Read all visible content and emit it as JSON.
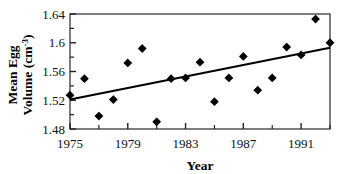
{
  "chart_data": {
    "type": "scatter",
    "title": "",
    "xlabel": "Year",
    "ylabel": "Mean Egg Volume (cm3)",
    "ylabel_line1": "Mean Egg",
    "ylabel_line2_prefix": "Volume (cm",
    "ylabel_line2_superscript": "-3",
    "ylabel_line2_suffix": ")",
    "xlim": [
      1975,
      1993
    ],
    "ylim": [
      1.48,
      1.64
    ],
    "grid": false,
    "legend": null,
    "x_tick_labels": [
      "1975",
      "1979",
      "1983",
      "1987",
      "1991"
    ],
    "x_tick_values": [
      1975,
      1979,
      1983,
      1987,
      1991
    ],
    "x_minor_tick_values": [
      1977,
      1981,
      1985,
      1989,
      1993
    ],
    "y_tick_labels": [
      "1.48",
      "1.52",
      "1.56",
      "1.6",
      "1.64"
    ],
    "y_tick_values": [
      1.48,
      1.52,
      1.56,
      1.6,
      1.64
    ],
    "y_minor_tick_values": [
      1.5,
      1.54,
      1.58,
      1.62
    ],
    "x": [
      1975,
      1976,
      1977,
      1978,
      1979,
      1980,
      1981,
      1982,
      1983,
      1984,
      1985,
      1986,
      1987,
      1988,
      1989,
      1990,
      1991,
      1992,
      1993
    ],
    "values": [
      1.527,
      1.55,
      1.498,
      1.521,
      1.572,
      1.592,
      1.49,
      1.55,
      1.551,
      1.573,
      1.518,
      1.551,
      1.581,
      1.534,
      1.551,
      1.594,
      1.583,
      1.633,
      1.6
    ],
    "series": [
      {
        "name": "Mean egg volume",
        "type": "scatter",
        "marker": "diamond",
        "color": "#000000",
        "x": [
          1975,
          1976,
          1977,
          1978,
          1979,
          1980,
          1981,
          1982,
          1983,
          1984,
          1985,
          1986,
          1987,
          1988,
          1989,
          1990,
          1991,
          1992,
          1993
        ],
        "values": [
          1.527,
          1.55,
          1.498,
          1.521,
          1.572,
          1.592,
          1.49,
          1.55,
          1.551,
          1.573,
          1.518,
          1.551,
          1.581,
          1.534,
          1.551,
          1.594,
          1.583,
          1.633,
          1.6
        ]
      },
      {
        "name": "Linear trend line",
        "type": "line",
        "color": "#000000",
        "x": [
          1975,
          1993
        ],
        "values": [
          1.521,
          1.593
        ]
      }
    ]
  },
  "axes": {
    "x_title": "Year",
    "y_title_line1": "Mean Egg",
    "y_title_line2": "Volume (cm"
  }
}
